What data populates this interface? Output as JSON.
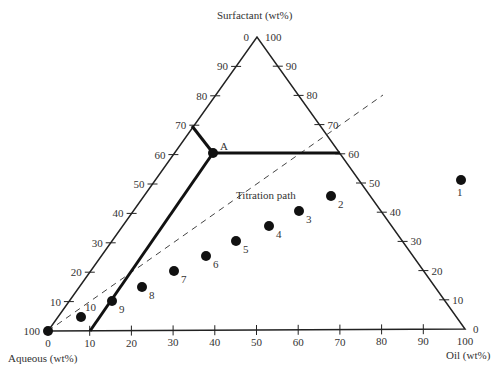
{
  "diagram": {
    "type": "ternary",
    "axes": {
      "top": "Surfactant (wt%)",
      "left": "Aqueous (wt%)",
      "right": "Oil (wt%)"
    },
    "ticks": [
      0,
      10,
      20,
      30,
      40,
      50,
      60,
      70,
      80,
      90,
      100
    ],
    "point_A_label": "A",
    "titration_label": "Titration path",
    "points": [
      {
        "label": "1",
        "x": 461,
        "y": 180
      },
      {
        "label": "2",
        "x": 331,
        "y": 196
      },
      {
        "label": "3",
        "x": 299,
        "y": 211
      },
      {
        "label": "4",
        "x": 269,
        "y": 226
      },
      {
        "label": "5",
        "x": 236,
        "y": 241
      },
      {
        "label": "6",
        "x": 206,
        "y": 256
      },
      {
        "label": "7",
        "x": 174,
        "y": 271
      },
      {
        "label": "8",
        "x": 142,
        "y": 287
      },
      {
        "label": "9",
        "x": 112,
        "y": 301
      },
      {
        "label": "10",
        "x": 81,
        "y": 317
      }
    ]
  },
  "chart_data": {
    "type": "ternary",
    "title": "",
    "axis_labels": {
      "top": "Surfactant (wt%)",
      "bottom_left": "Aqueous (wt%)",
      "bottom_right": "Oil (wt%)"
    },
    "point_A": {
      "label": "A",
      "surfactant": 60,
      "oil": 0,
      "aqueous": 40
    },
    "phase_boundaries": [
      {
        "from": "left axis 30% surfactant",
        "to": "A"
      },
      {
        "from": "A",
        "to": "right edge 60% surfactant"
      },
      {
        "from": "A",
        "to": "bottom axis 10% oil"
      }
    ],
    "titration_path": "dashed line from Aqueous vertex through ~70 on right edge",
    "titration_points": [
      "1",
      "2",
      "3",
      "4",
      "5",
      "6",
      "7",
      "8",
      "9",
      "10"
    ]
  }
}
